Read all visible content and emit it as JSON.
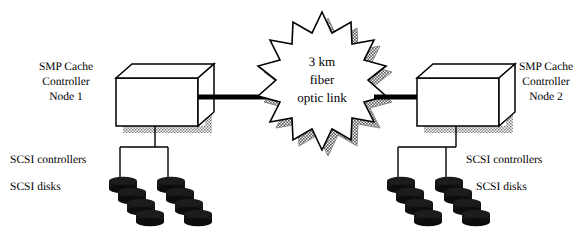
{
  "diagram": {
    "background_color": "#ffffff",
    "line_color": "#000000",
    "shadow_color": "#8a8a8a",
    "disk_color": "#151515",
    "nodes": [
      {
        "id": "node-1",
        "label_lines": [
          "SMP Cache",
          "Controller",
          "Node 1"
        ],
        "scsi_controllers_label": "SCSI controllers",
        "scsi_disks_label": "SCSI disks",
        "controller_count": 2,
        "disk_count": 8
      },
      {
        "id": "node-2",
        "label_lines": [
          "SMP Cache",
          "Controller",
          "Node 2"
        ],
        "scsi_controllers_label": "SCSI controllers",
        "scsi_disks_label": "SCSI disks",
        "controller_count": 2,
        "disk_count": 8
      }
    ],
    "link": {
      "label_lines": [
        "3 km",
        "fiber",
        "optic link"
      ],
      "shape": "starburst",
      "points": 14
    }
  },
  "node1": {
    "label_line1": "SMP Cache",
    "label_line2": "Controller",
    "label_line3": "Node 1",
    "scsi_controllers": "SCSI controllers",
    "scsi_disks": "SCSI disks"
  },
  "node2": {
    "label_line1": "SMP Cache",
    "label_line2": "Controller",
    "label_line3": "Node 2",
    "scsi_controllers": "SCSI controllers",
    "scsi_disks": "SCSI disks"
  },
  "link": {
    "line1": "3 km",
    "line2": "fiber",
    "line3": "optic link"
  }
}
